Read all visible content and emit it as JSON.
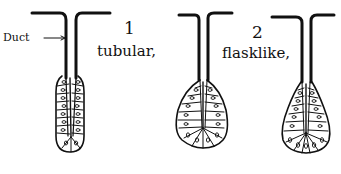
{
  "diagram": {
    "labels": {
      "duct": "Duct",
      "figure1_number": "1",
      "figure1_name": "tubular,",
      "figure2_number": "2",
      "figure2_name": "flasklike,"
    },
    "glands": [
      {
        "id": "tubular",
        "shape": "tubular"
      },
      {
        "id": "flasklike-a",
        "shape": "flask"
      },
      {
        "id": "flasklike-b",
        "shape": "flask"
      }
    ],
    "colors": {
      "ink": "#111111",
      "background": "#ffffff"
    }
  }
}
